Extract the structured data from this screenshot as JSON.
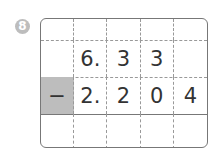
{
  "problem_number": "8",
  "grid": {
    "rows": [
      [
        "",
        "",
        "",
        "",
        ""
      ],
      [
        "",
        "6.",
        "3",
        "3",
        ""
      ],
      [
        "−",
        "2.",
        "2",
        "0",
        "4"
      ],
      [
        "",
        "",
        "",
        "",
        ""
      ]
    ]
  },
  "colors": {
    "operator_cell": "#bdbdbd",
    "badge": "#bdbdbd"
  }
}
